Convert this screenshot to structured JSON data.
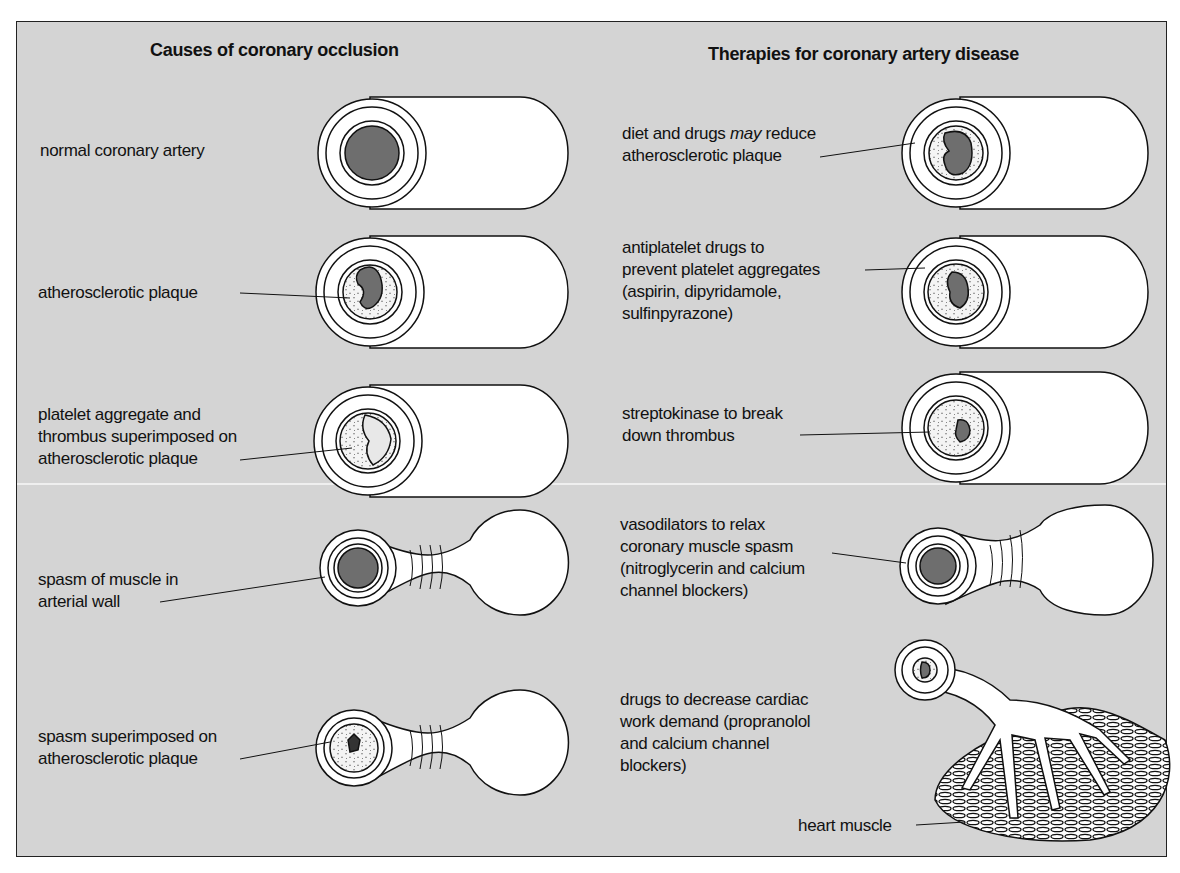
{
  "figure": {
    "left_column": {
      "title": "Causes of coronary occlusion",
      "items": [
        {
          "label": "normal coronary artery",
          "illustration": "normal-artery"
        },
        {
          "label": "atherosclerotic plaque",
          "illustration": "plaque-artery"
        },
        {
          "label": "platelet aggregate and\nthrombus superimposed on\natherosclerotic plaque",
          "illustration": "thrombus-artery"
        },
        {
          "label": "spasm of muscle in\narterial wall",
          "illustration": "spasm-artery"
        },
        {
          "label": "spasm superimposed on\natherosclerotic plaque",
          "illustration": "spasm-plaque-artery"
        }
      ]
    },
    "right_column": {
      "title": "Therapies for coronary artery disease",
      "items": [
        {
          "label_pre": "diet and drugs ",
          "label_em": "may",
          "label_post": " reduce\natherosclerotic plaque",
          "illustration": "reduced-plaque-artery"
        },
        {
          "label": "antiplatelet drugs to\nprevent platelet aggregates\n(aspirin, dipyridamole,\nsulfinpyrazone)",
          "illustration": "antiplatelet-artery"
        },
        {
          "label": "streptokinase to break\ndown thrombus",
          "illustration": "streptokinase-artery"
        },
        {
          "label": "vasodilators to relax\ncoronary muscle spasm\n(nitroglycerin and calcium\nchannel blockers)",
          "illustration": "vasodilator-artery"
        },
        {
          "label": "drugs to decrease cardiac\nwork demand (propranolol\nand calcium channel\nblockers)",
          "illustration": "branching-artery"
        },
        {
          "label": "heart muscle",
          "illustration": "heart-muscle"
        }
      ]
    },
    "colors": {
      "background": "#d4d4d4",
      "lumen": "#6e6e6e",
      "vessel": "#ffffff",
      "ink": "#111111"
    }
  }
}
